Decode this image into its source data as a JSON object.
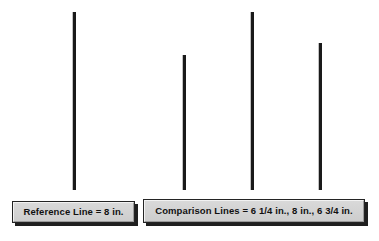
{
  "figure": {
    "background_color": "#ffffff",
    "line_color": "#1a1a1a",
    "box_fill_color": "#d2d2d2",
    "box_border_color": "#242424",
    "text_color": "#111111"
  },
  "captions": {
    "reference": "Reference Line = 8 in.",
    "comparison": "Comparison Lines = 6 1/4 in., 8 in., 6 3/4 in."
  },
  "lines": [
    {
      "name": "reference-line",
      "group": "reference",
      "length_label": "8 in.",
      "length_inches": 8
    },
    {
      "name": "comparison-line-1",
      "group": "comparison",
      "length_label": "6 1/4 in.",
      "length_inches": 6.25
    },
    {
      "name": "comparison-line-2",
      "group": "comparison",
      "length_label": "8 in.",
      "length_inches": 8
    },
    {
      "name": "comparison-line-3",
      "group": "comparison",
      "length_label": "6 3/4 in.",
      "length_inches": 6.75
    }
  ]
}
